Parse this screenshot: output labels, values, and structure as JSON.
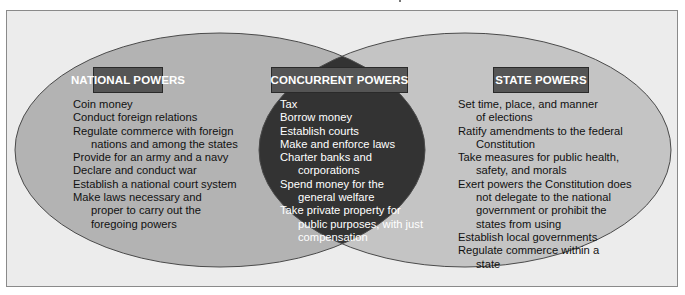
{
  "diagram": {
    "type": "venn",
    "colors": {
      "frame_bg": "#ececec",
      "frame_border": "#8a8a8a",
      "circle_fill": "#b3b3b3",
      "intersection_fill": "#333333",
      "header_bg": "#555555",
      "header_text": "#ffffff"
    },
    "national": {
      "title": "NATIONAL POWERS",
      "items": [
        "Coin money",
        "Conduct foreign relations",
        "Regulate commerce with foreign nations and among the states",
        "Provide for an army and a navy",
        "Declare and conduct war",
        "Establish a national court system",
        "Make laws necessary and proper to carry out the foregoing powers"
      ]
    },
    "concurrent": {
      "title": "CONCURRENT POWERS",
      "items": [
        "Tax",
        "Borrow money",
        "Establish courts",
        "Make and enforce laws",
        "Charter banks and corporations",
        "Spend money for the general welfare",
        "Take private property for public purposes, with just compensation"
      ]
    },
    "state": {
      "title": "STATE POWERS",
      "items": [
        "Set time, place, and manner of elections",
        "Ratify amendments to the federal Constitution",
        "Take measures for public health, safety, and morals",
        "Exert powers the Constitution does not delegate to the national government or prohibit the states from using",
        "Establish local governments",
        "Regulate commerce within a state"
      ]
    }
  }
}
